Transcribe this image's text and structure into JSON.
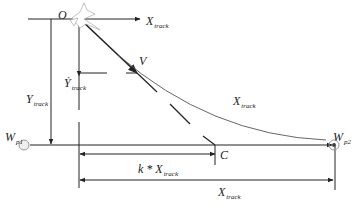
{
  "diagram": {
    "type": "waypoint-tracking-geometry",
    "labels": {
      "origin": "O",
      "x_axis": {
        "main": "X",
        "sub": "track"
      },
      "y_axis": {
        "main": "Y",
        "sub": "track"
      },
      "y_dot": {
        "main": "Ẏ",
        "sub": "track"
      },
      "velocity": "V",
      "curve": {
        "main": "X",
        "sub": "track"
      },
      "wp1": {
        "main": "W",
        "sub": "p1"
      },
      "wp2": {
        "main": "W",
        "sub": "p2"
      },
      "point_c": "C",
      "k_dist": {
        "main": "k * X",
        "sub": "track"
      },
      "total_dist": {
        "main": "X",
        "sub": "track"
      }
    },
    "icons": {
      "aircraft": "aircraft-icon",
      "wp1": "waypoint-circle-icon",
      "wp2": "waypoint-target-icon"
    },
    "colors": {
      "line": "#222222",
      "curve": "#555555",
      "waypoint": "#999999"
    }
  }
}
